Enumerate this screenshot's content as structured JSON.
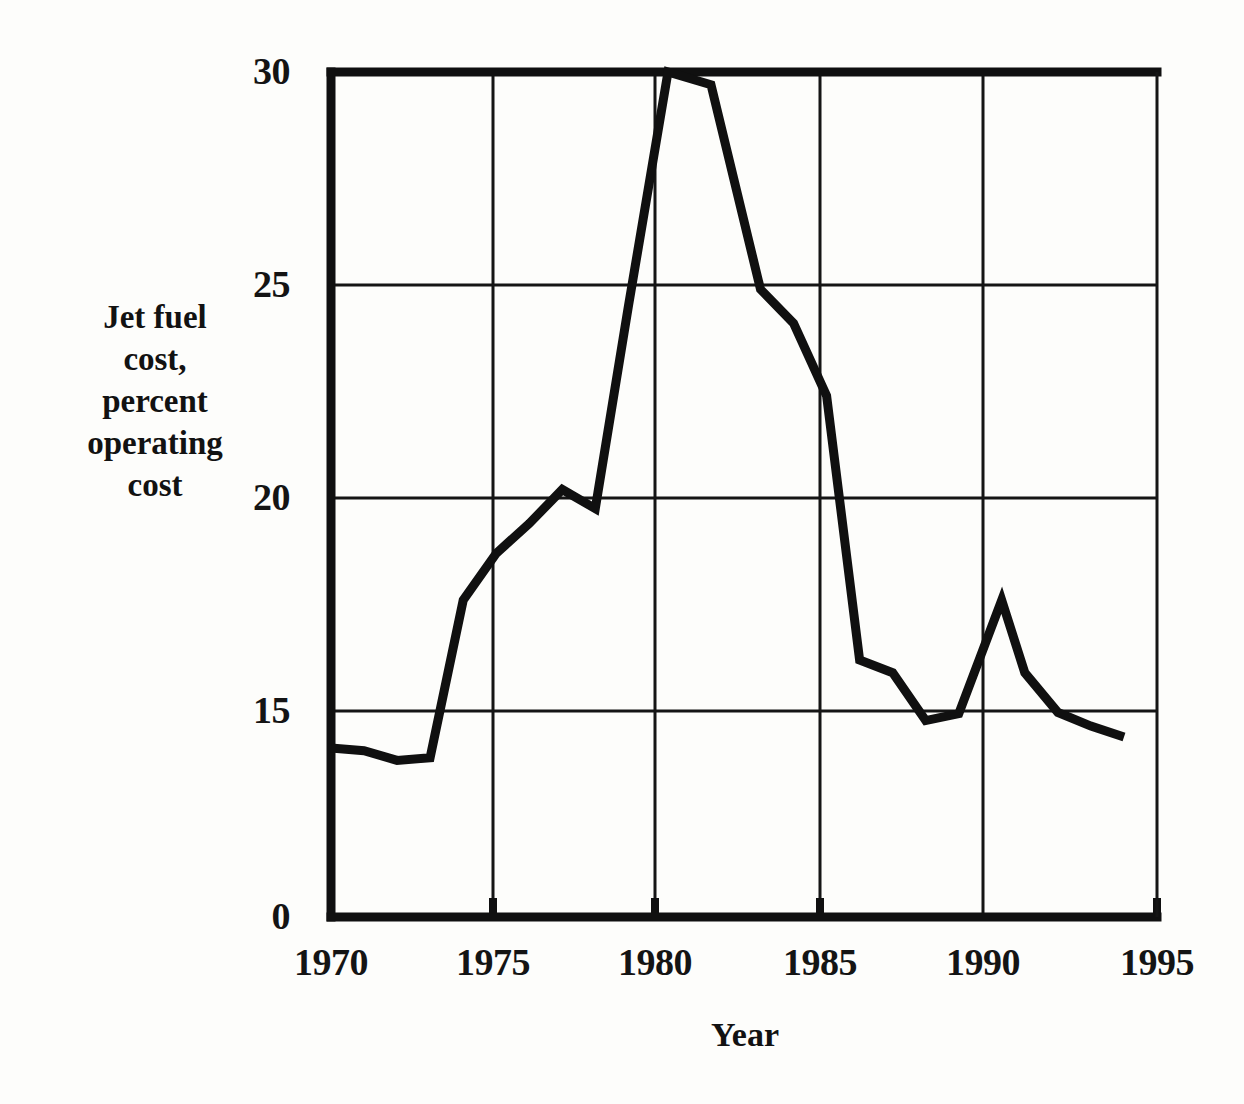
{
  "chart_data": {
    "type": "line",
    "title": "",
    "xlabel": "Year",
    "ylabel": "Jet fuel cost, percent operating cost",
    "ylabel_lines": [
      "Jet fuel",
      "cost,",
      "percent",
      "operating",
      "cost"
    ],
    "xlim": [
      1970,
      1995
    ],
    "ylim": [
      0,
      30
    ],
    "y_axis_note": "broken axis: 0 shown at baseline, linear region spans 15 to 30",
    "yticks": [
      0,
      15,
      20,
      25,
      30
    ],
    "ytick_labels": [
      "0",
      "15",
      "20",
      "25",
      "30"
    ],
    "xticks": [
      1970,
      1975,
      1980,
      1985,
      1990,
      1995
    ],
    "xtick_labels": [
      "1970",
      "1975",
      "1980",
      "1985",
      "1990",
      "1995"
    ],
    "grid": true,
    "grid_vertical_at": [
      1975,
      1980,
      1985,
      1990
    ],
    "grid_horizontal_at": [
      15,
      20,
      25
    ],
    "legend": null,
    "series": [
      {
        "name": "Jet fuel cost, percent operating cost",
        "color": "#101010",
        "line_width": 9,
        "x": [
          1970,
          1971,
          1972,
          1973,
          1974,
          1975,
          1976,
          1977,
          1978,
          1979,
          1980.2,
          1981.5,
          1983,
          1984,
          1985,
          1986,
          1987,
          1988,
          1989,
          1990.3,
          1991,
          1992,
          1993,
          1994
        ],
        "y": [
          12.3,
          12.1,
          11.4,
          11.6,
          17.6,
          18.7,
          19.4,
          20.2,
          19.75,
          24.5,
          30.0,
          29.7,
          24.9,
          24.1,
          22.4,
          16.2,
          15.9,
          14.3,
          14.8,
          17.6,
          15.9,
          14.9,
          13.9,
          13.1
        ]
      }
    ]
  },
  "axis_color": "#101010",
  "background_color": "#fdfdfb",
  "ytick_positions": {
    "0": 917,
    "15": 711,
    "20": 498,
    "25": 285,
    "30": 72
  },
  "xtick_positions": {
    "1970": 331,
    "1975": 493,
    "1980": 655,
    "1985": 820,
    "1990": 983,
    "1995": 1157
  }
}
